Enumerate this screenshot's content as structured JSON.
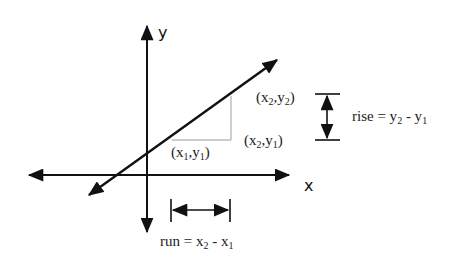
{
  "diagram": {
    "axes": {
      "x_label": "x",
      "y_label": "y"
    },
    "points": {
      "p1": {
        "label_base_x": "(x",
        "sub_x": "1",
        "sep": ",y",
        "sub_y": "1",
        "close": ")"
      },
      "p2": {
        "label_base_x": "(x",
        "sub_x": "2",
        "sep": ",y",
        "sub_y": "2",
        "close": ")"
      },
      "corner": {
        "label_base_x": "(x",
        "sub_x": "2",
        "sep": ",y",
        "sub_y": "1",
        "close": ")"
      }
    },
    "rise": {
      "prefix": "rise = y",
      "sub_a": "2",
      "mid": " - y",
      "sub_b": "1"
    },
    "run": {
      "prefix": "run = x",
      "sub_a": "2",
      "mid": " - x",
      "sub_b": "1"
    },
    "colors": {
      "stroke": "#111111",
      "guide": "#bbbbbb",
      "text": "#222222"
    }
  }
}
